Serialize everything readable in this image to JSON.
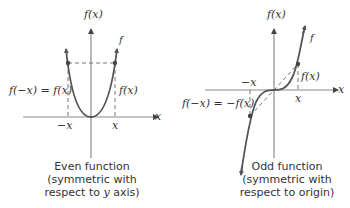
{
  "even_graph": {
    "y_axis_label": "f(x)",
    "x_axis_label": "x",
    "curve_label": "f",
    "left_value_label": "f(−x) = f(x)",
    "right_value_label": "f(x)",
    "neg_x_tick": "−x",
    "pos_x_tick": "x",
    "caption_line1": "Even function",
    "caption_line2": "(symmetric with",
    "caption_line3_prefix": "respect to ",
    "caption_line3_var": "y",
    "caption_line3_suffix": " axis)"
  },
  "odd_graph": {
    "y_axis_label": "f(x)",
    "x_axis_label": "x",
    "curve_label": "f",
    "left_value_label": "f(−x) = −f(x)",
    "right_value_label": "f(x)",
    "neg_x_tick": "−x",
    "pos_x_tick": "x",
    "caption_line1": "Odd function",
    "caption_line2": "(symmetric with",
    "caption_line3": "respect to origin)"
  },
  "colors": {
    "axis": "#8a8a8a",
    "curve": "#555555",
    "dashed": "#777777"
  }
}
